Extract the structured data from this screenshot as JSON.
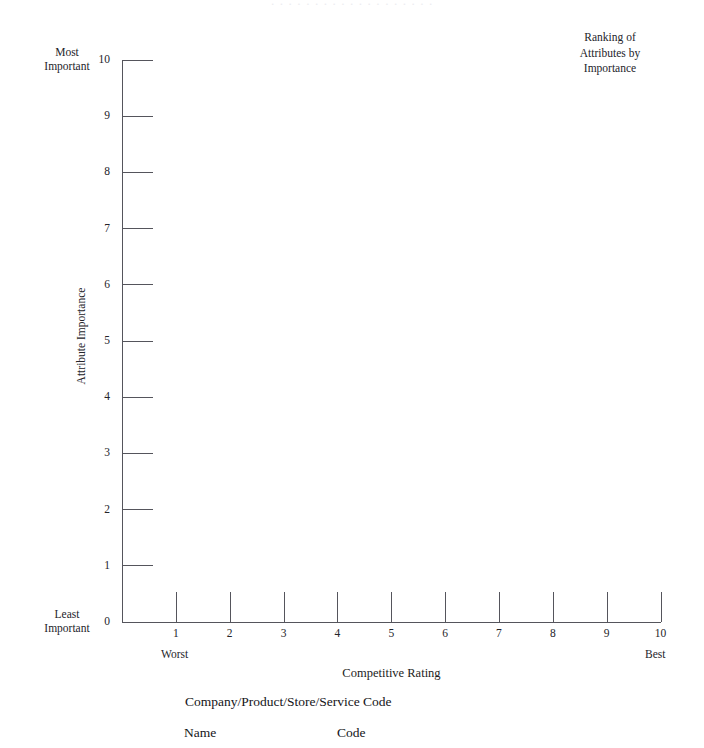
{
  "document": {
    "scan_ghost_text": "· · · · · · · · · · · · · · · · · · ·",
    "background_color": "#ffffff",
    "ink_color": "#24242a",
    "line_color": "#55555c"
  },
  "corner_title": {
    "line1": "Ranking of",
    "line2": "Attributes by",
    "line3": "Importance"
  },
  "y_axis": {
    "title": "Attribute Importance",
    "top_label_line1": "Most",
    "top_label_line2": "Important",
    "bottom_label_line1": "Least",
    "bottom_label_line2": "Important"
  },
  "x_axis": {
    "title": "Competitive Rating",
    "left_label": "Worst",
    "right_label": "Best"
  },
  "legend": {
    "heading": "Company/Product/Store/Service Code",
    "col_name": "Name",
    "col_code": "Code"
  },
  "chart_data": {
    "type": "scatter",
    "title": "Ranking of Attributes by Importance",
    "xlabel": "Competitive Rating",
    "ylabel": "Attribute Importance",
    "xlim": [
      0,
      10
    ],
    "ylim": [
      0,
      10
    ],
    "x_ticks": [
      1,
      2,
      3,
      4,
      5,
      6,
      7,
      8,
      9,
      10
    ],
    "y_ticks": [
      0,
      1,
      2,
      3,
      4,
      5,
      6,
      7,
      8,
      9,
      10
    ],
    "x_tick_labels": [
      "1",
      "2",
      "3",
      "4",
      "5",
      "6",
      "7",
      "8",
      "9",
      "10"
    ],
    "y_tick_labels": [
      "0",
      "1",
      "2",
      "3",
      "4",
      "5",
      "6",
      "7",
      "8",
      "9",
      "10"
    ],
    "x_axis_anchor_labels": {
      "min": "Worst",
      "max": "Best"
    },
    "y_axis_anchor_labels": {
      "min": "Least Important",
      "max": "Most Important"
    },
    "grid": false,
    "legend_position": "below-plot",
    "series": [],
    "values": [],
    "annotation": "Blank plotting template — no data points are plotted."
  }
}
